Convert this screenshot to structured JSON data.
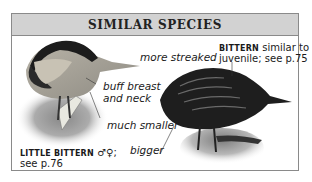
{
  "box": {
    "title": "SIMILAR SPECIES",
    "header_bg": "#d2d2d2",
    "border_color": "#8a8a8a"
  },
  "annotations": {
    "buff_breast_line1": "buff breast",
    "buff_breast_line2": "and neck",
    "much_smaller": "much smaller",
    "bigger": "bigger",
    "more_streaked": "more streaked"
  },
  "captions": {
    "little_bittern": {
      "name": "LITTLE BITTERN",
      "symbols": "♂♀;",
      "ref": "see p.76"
    },
    "bittern": {
      "name": "BITTERN",
      "text_line1": "similar to",
      "text_line2": "juvenile; see p.75"
    }
  },
  "images": [
    {
      "name": "little-bittern-illustration",
      "description": "Little Bittern perched on reed, buff breast"
    },
    {
      "name": "bittern-illustration",
      "description": "Bittern, dark streaked plumage"
    }
  ]
}
